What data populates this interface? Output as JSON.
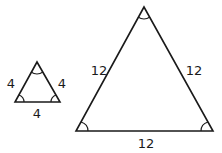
{
  "diagram": {
    "type": "similar-triangles",
    "stroke_color": "#1a1a1a",
    "small_triangle": {
      "sides": {
        "left": "4",
        "right": "4",
        "base": "4"
      },
      "angle_marks": [
        "apex",
        "bottom-left",
        "bottom-right"
      ]
    },
    "large_triangle": {
      "sides": {
        "left": "12",
        "right": "12",
        "base": "12"
      },
      "angle_marks": [
        "apex",
        "bottom-left",
        "bottom-right"
      ]
    }
  }
}
